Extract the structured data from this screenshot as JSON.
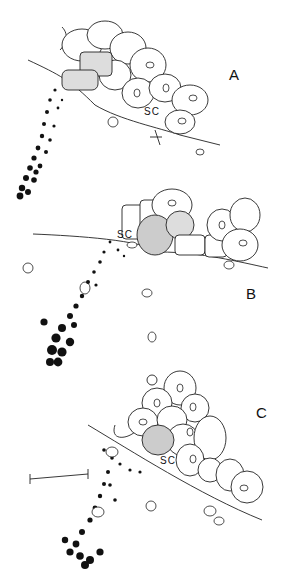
{
  "figure": {
    "panels": [
      {
        "id": "A",
        "label": "A",
        "sc_label": "SC"
      },
      {
        "id": "B",
        "label": "B",
        "sc_label": "SC"
      },
      {
        "id": "C",
        "label": "C",
        "sc_label": "SC"
      }
    ],
    "scale_bar": {
      "present": true
    },
    "colors": {
      "ink": "#111111",
      "background": "#ffffff"
    }
  }
}
